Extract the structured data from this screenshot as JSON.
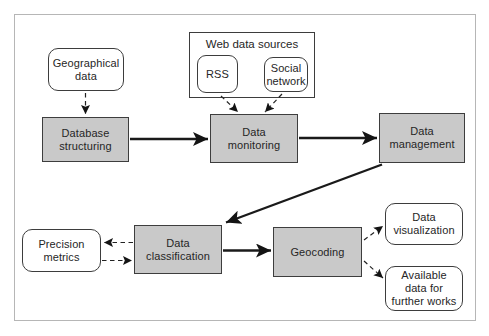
{
  "diagram": {
    "group": {
      "title": "Web data sources"
    },
    "nodes": {
      "geographical_data": {
        "label": "Geographical data",
        "shape": "rounded"
      },
      "rss": {
        "label": "RSS",
        "shape": "rounded"
      },
      "social_network": {
        "label": "Social network",
        "shape": "rounded"
      },
      "database_structuring": {
        "label": "Database structuring",
        "shape": "process"
      },
      "data_monitoring": {
        "label": "Data monitoring",
        "shape": "process"
      },
      "data_management": {
        "label": "Data management",
        "shape": "process"
      },
      "precision_metrics": {
        "label": "Precision metrics",
        "shape": "rounded"
      },
      "data_classification": {
        "label": "Data classification",
        "shape": "process"
      },
      "geocoding": {
        "label": "Geocoding",
        "shape": "process"
      },
      "data_visualization": {
        "label": "Data visualization",
        "shape": "rounded"
      },
      "available_data": {
        "label": "Available data for further works",
        "shape": "rounded"
      }
    },
    "edges": [
      {
        "from": "geographical_data",
        "to": "database_structuring",
        "style": "dashed"
      },
      {
        "from": "rss",
        "to": "data_monitoring",
        "style": "dashed"
      },
      {
        "from": "social_network",
        "to": "data_monitoring",
        "style": "dashed"
      },
      {
        "from": "database_structuring",
        "to": "data_monitoring",
        "style": "solid"
      },
      {
        "from": "data_monitoring",
        "to": "data_management",
        "style": "solid"
      },
      {
        "from": "data_management",
        "to": "data_classification",
        "style": "solid"
      },
      {
        "from": "data_classification",
        "to": "precision_metrics",
        "style": "dashed"
      },
      {
        "from": "precision_metrics",
        "to": "data_classification",
        "style": "dashed"
      },
      {
        "from": "data_classification",
        "to": "geocoding",
        "style": "solid"
      },
      {
        "from": "geocoding",
        "to": "data_visualization",
        "style": "dashed"
      },
      {
        "from": "geocoding",
        "to": "available_data",
        "style": "dashed"
      }
    ],
    "colors": {
      "process_fill": "#c9c9c9",
      "node_border": "#3d3d3d",
      "arrow": "#1a1a1a",
      "frame_border": "#b6b6b6"
    }
  }
}
